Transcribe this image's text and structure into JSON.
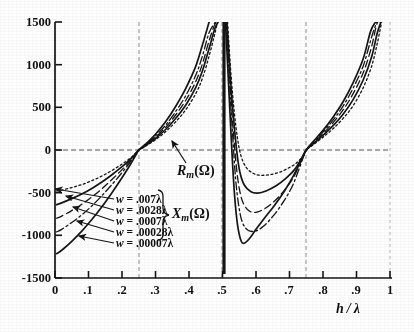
{
  "chart_data": {
    "type": "line",
    "title": "",
    "xlabel": "h / λ",
    "ylabel": "",
    "xlim": [
      0,
      1
    ],
    "ylim": [
      -1500,
      1500
    ],
    "grid": "dashed vertical gridlines at .25, .5, .75 and dashed horizontal gridline at 0",
    "legend_position": "lower-left inside plot, with arrows pointing to each curve",
    "x_ticks": [
      "0",
      ".1",
      ".2",
      ".3",
      ".4",
      ".5",
      ".6",
      ".7",
      ".8",
      ".9",
      "1"
    ],
    "x_tick_values": [
      0,
      0.1,
      0.2,
      0.3,
      0.4,
      0.5,
      0.6,
      0.7,
      0.8,
      0.9,
      1
    ],
    "y_ticks": [
      "1500",
      "1000",
      "500",
      "0",
      "-500",
      "-1000",
      "-1500"
    ],
    "y_tick_values": [
      1500,
      1000,
      500,
      0,
      -500,
      -1000,
      -1500
    ],
    "gridlines_x": [
      0.25,
      0.5,
      0.75
    ],
    "gridlines_y": [
      0
    ],
    "asymptotes": [
      0.25,
      0.5,
      0.75
    ],
    "annotations": [
      {
        "text": "R_m(Ω)",
        "points_to": "resistance curve bundle near h/λ = .40"
      },
      {
        "text": "X_m(Ω)",
        "points_to": "brace grouping the five width legend rows"
      }
    ],
    "series": [
      {
        "name": "w = .007λ",
        "style": "dotted",
        "w_value": 0.007,
        "points": [
          [
            0.005,
            -480
          ],
          [
            0.02,
            -470
          ],
          [
            0.05,
            -440
          ],
          [
            0.08,
            -405
          ],
          [
            0.11,
            -360
          ],
          [
            0.14,
            -305
          ],
          [
            0.17,
            -240
          ],
          [
            0.2,
            -165
          ],
          [
            0.225,
            -95
          ],
          [
            0.245,
            -20
          ],
          [
            0.25,
            0
          ],
          [
            0.27,
            45
          ],
          [
            0.3,
            120
          ],
          [
            0.33,
            215
          ],
          [
            0.36,
            330
          ],
          [
            0.39,
            470
          ],
          [
            0.42,
            660
          ],
          [
            0.44,
            840
          ],
          [
            0.46,
            1100
          ],
          [
            0.475,
            1330
          ],
          [
            0.485,
            1500
          ],
          [
            0.515,
            1500
          ],
          [
            0.525,
            900
          ],
          [
            0.535,
            450
          ],
          [
            0.545,
            130
          ],
          [
            0.555,
            -65
          ],
          [
            0.57,
            -200
          ],
          [
            0.59,
            -270
          ],
          [
            0.61,
            -295
          ],
          [
            0.64,
            -290
          ],
          [
            0.67,
            -260
          ],
          [
            0.7,
            -205
          ],
          [
            0.72,
            -155
          ],
          [
            0.74,
            -70
          ],
          [
            0.75,
            0
          ],
          [
            0.77,
            60
          ],
          [
            0.8,
            150
          ],
          [
            0.83,
            250
          ],
          [
            0.86,
            370
          ],
          [
            0.89,
            520
          ],
          [
            0.92,
            730
          ],
          [
            0.945,
            980
          ],
          [
            0.962,
            1250
          ],
          [
            0.975,
            1500
          ]
        ]
      },
      {
        "name": "w = .0028λ",
        "style": "solid",
        "w_value": 0.0028,
        "points": [
          [
            0.005,
            -640
          ],
          [
            0.02,
            -620
          ],
          [
            0.05,
            -570
          ],
          [
            0.08,
            -515
          ],
          [
            0.11,
            -450
          ],
          [
            0.14,
            -375
          ],
          [
            0.17,
            -290
          ],
          [
            0.2,
            -195
          ],
          [
            0.225,
            -110
          ],
          [
            0.245,
            -22
          ],
          [
            0.25,
            0
          ],
          [
            0.27,
            50
          ],
          [
            0.3,
            135
          ],
          [
            0.33,
            240
          ],
          [
            0.36,
            370
          ],
          [
            0.39,
            525
          ],
          [
            0.42,
            730
          ],
          [
            0.44,
            925
          ],
          [
            0.46,
            1190
          ],
          [
            0.477,
            1420
          ],
          [
            0.487,
            1500
          ],
          [
            0.513,
            1500
          ],
          [
            0.524,
            820
          ],
          [
            0.534,
            330
          ],
          [
            0.543,
            -30
          ],
          [
            0.552,
            -260
          ],
          [
            0.565,
            -410
          ],
          [
            0.585,
            -490
          ],
          [
            0.605,
            -505
          ],
          [
            0.63,
            -480
          ],
          [
            0.66,
            -420
          ],
          [
            0.69,
            -330
          ],
          [
            0.715,
            -230
          ],
          [
            0.735,
            -105
          ],
          [
            0.75,
            0
          ],
          [
            0.77,
            70
          ],
          [
            0.8,
            170
          ],
          [
            0.83,
            285
          ],
          [
            0.86,
            420
          ],
          [
            0.89,
            590
          ],
          [
            0.92,
            820
          ],
          [
            0.945,
            1090
          ],
          [
            0.962,
            1370
          ],
          [
            0.973,
            1500
          ]
        ]
      },
      {
        "name": "w = .0007λ",
        "style": "dashed",
        "w_value": 0.0007,
        "points": [
          [
            0.005,
            -800
          ],
          [
            0.02,
            -775
          ],
          [
            0.05,
            -710
          ],
          [
            0.08,
            -635
          ],
          [
            0.11,
            -550
          ],
          [
            0.14,
            -455
          ],
          [
            0.17,
            -345
          ],
          [
            0.2,
            -230
          ],
          [
            0.225,
            -125
          ],
          [
            0.245,
            -25
          ],
          [
            0.25,
            0
          ],
          [
            0.27,
            55
          ],
          [
            0.3,
            150
          ],
          [
            0.33,
            265
          ],
          [
            0.36,
            410
          ],
          [
            0.39,
            580
          ],
          [
            0.42,
            800
          ],
          [
            0.44,
            1010
          ],
          [
            0.46,
            1280
          ],
          [
            0.478,
            1480
          ],
          [
            0.488,
            1500
          ],
          [
            0.512,
            1500
          ],
          [
            0.523,
            760
          ],
          [
            0.532,
            230
          ],
          [
            0.541,
            -180
          ],
          [
            0.55,
            -450
          ],
          [
            0.562,
            -625
          ],
          [
            0.58,
            -715
          ],
          [
            0.6,
            -730
          ],
          [
            0.625,
            -690
          ],
          [
            0.655,
            -600
          ],
          [
            0.685,
            -470
          ],
          [
            0.712,
            -320
          ],
          [
            0.733,
            -145
          ],
          [
            0.75,
            0
          ],
          [
            0.77,
            80
          ],
          [
            0.8,
            190
          ],
          [
            0.83,
            320
          ],
          [
            0.86,
            470
          ],
          [
            0.89,
            660
          ],
          [
            0.92,
            905
          ],
          [
            0.944,
            1195
          ],
          [
            0.961,
            1480
          ],
          [
            0.971,
            1500
          ]
        ]
      },
      {
        "name": "w = .00028λ",
        "style": "dash-dot",
        "w_value": 0.00028,
        "points": [
          [
            0.005,
            -960
          ],
          [
            0.02,
            -930
          ],
          [
            0.05,
            -850
          ],
          [
            0.08,
            -760
          ],
          [
            0.11,
            -655
          ],
          [
            0.14,
            -535
          ],
          [
            0.17,
            -405
          ],
          [
            0.2,
            -265
          ],
          [
            0.225,
            -140
          ],
          [
            0.245,
            -28
          ],
          [
            0.25,
            0
          ],
          [
            0.27,
            60
          ],
          [
            0.3,
            165
          ],
          [
            0.33,
            290
          ],
          [
            0.36,
            450
          ],
          [
            0.39,
            635
          ],
          [
            0.42,
            875
          ],
          [
            0.44,
            1100
          ],
          [
            0.46,
            1375
          ],
          [
            0.479,
            1500
          ],
          [
            0.511,
            1500
          ],
          [
            0.522,
            700
          ],
          [
            0.531,
            130
          ],
          [
            0.539,
            -330
          ],
          [
            0.548,
            -640
          ],
          [
            0.559,
            -845
          ],
          [
            0.576,
            -940
          ],
          [
            0.598,
            -950
          ],
          [
            0.622,
            -895
          ],
          [
            0.652,
            -770
          ],
          [
            0.683,
            -600
          ],
          [
            0.71,
            -410
          ],
          [
            0.732,
            -185
          ],
          [
            0.75,
            0
          ],
          [
            0.77,
            88
          ],
          [
            0.8,
            210
          ],
          [
            0.83,
            350
          ],
          [
            0.86,
            515
          ],
          [
            0.89,
            725
          ],
          [
            0.92,
            985
          ],
          [
            0.943,
            1295
          ],
          [
            0.96,
            1500
          ]
        ]
      },
      {
        "name": "w = .00007λ",
        "style": "solid",
        "w_value": 7e-05,
        "points": [
          [
            0.005,
            -1215
          ],
          [
            0.02,
            -1175
          ],
          [
            0.05,
            -1070
          ],
          [
            0.08,
            -950
          ],
          [
            0.11,
            -815
          ],
          [
            0.14,
            -665
          ],
          [
            0.17,
            -500
          ],
          [
            0.2,
            -325
          ],
          [
            0.225,
            -170
          ],
          [
            0.245,
            -32
          ],
          [
            0.25,
            0
          ],
          [
            0.27,
            68
          ],
          [
            0.3,
            185
          ],
          [
            0.33,
            330
          ],
          [
            0.36,
            510
          ],
          [
            0.39,
            720
          ],
          [
            0.42,
            980
          ],
          [
            0.44,
            1230
          ],
          [
            0.46,
            1500
          ],
          [
            0.509,
            1500
          ],
          [
            0.52,
            620
          ],
          [
            0.528,
            -10
          ],
          [
            0.536,
            -530
          ],
          [
            0.545,
            -880
          ],
          [
            0.556,
            -1070
          ],
          [
            0.566,
            -1090
          ],
          [
            0.58,
            -1040
          ],
          [
            0.6,
            -930
          ],
          [
            0.625,
            -800
          ],
          [
            0.655,
            -650
          ],
          [
            0.685,
            -480
          ],
          [
            0.712,
            -300
          ],
          [
            0.733,
            -135
          ],
          [
            0.75,
            0
          ],
          [
            0.77,
            95
          ],
          [
            0.8,
            230
          ],
          [
            0.83,
            385
          ],
          [
            0.86,
            565
          ],
          [
            0.89,
            790
          ],
          [
            0.92,
            1070
          ],
          [
            0.942,
            1390
          ],
          [
            0.957,
            1500
          ]
        ]
      }
    ]
  },
  "axis": {
    "x_title": "h / λ",
    "x_title_h": "h",
    "x_title_slash": "/",
    "x_title_lambda": "λ",
    "y_ticks": [
      "1500",
      "1000",
      "500",
      "0",
      "-500",
      "-1000",
      "-1500"
    ],
    "x_ticks": [
      "0",
      ".1",
      ".2",
      ".3",
      ".4",
      ".5",
      ".6",
      ".7",
      ".8",
      ".9",
      "1"
    ]
  },
  "labels": {
    "resistance": "R",
    "resistance_sub": "m",
    "resistance_unit": "(Ω)",
    "reactance": "X",
    "reactance_sub": "m",
    "reactance_unit": "(Ω)"
  },
  "legend": {
    "rows": [
      {
        "var": "w",
        "eq": "=",
        "value": ".007λ"
      },
      {
        "var": "w",
        "eq": "=",
        "value": ".0028λ"
      },
      {
        "var": "w",
        "eq": "=",
        "value": ".0007λ"
      },
      {
        "var": "w",
        "eq": "=",
        "value": ".00028λ"
      },
      {
        "var": "w",
        "eq": "=",
        "value": ".00007λ"
      }
    ]
  },
  "colors": {
    "ink": "#151515",
    "grid": "#888888",
    "paper": "#ffffff"
  }
}
